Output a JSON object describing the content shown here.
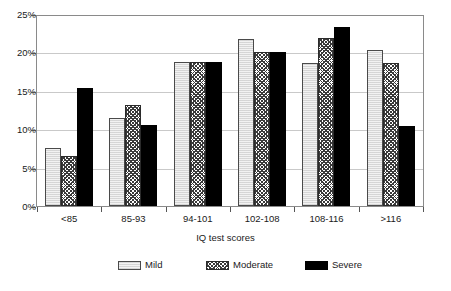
{
  "chart_data": {
    "type": "bar",
    "title": "",
    "xlabel": "IQ test scores",
    "ylabel": "",
    "categories": [
      "<85",
      "85-93",
      "94-101",
      "102-108",
      "108-116",
      ">116"
    ],
    "series": [
      {
        "name": "Mild",
        "values": [
          7.6,
          11.6,
          18.9,
          22.0,
          18.8,
          20.5
        ]
      },
      {
        "name": "Moderate",
        "values": [
          6.6,
          13.3,
          18.9,
          20.2,
          22.1,
          18.8
        ]
      },
      {
        "name": "Severe",
        "values": [
          15.5,
          10.6,
          18.9,
          20.2,
          23.6,
          10.5
        ]
      }
    ],
    "ylim": [
      0,
      25
    ],
    "ytick_labels": [
      "0%",
      "5%",
      "10%",
      "15%",
      "20%",
      "25%"
    ],
    "ytick_values": [
      0,
      5,
      10,
      15,
      20,
      25
    ],
    "grid": true,
    "grid_axis": "y",
    "legend_position": "bottom",
    "colors": {
      "mild": "#f2f2f2",
      "moderate": "#3a3a3a",
      "severe": "#000000",
      "axis": "#555555",
      "gridline": "#c9c9c9",
      "frame": "#8a8a8a",
      "text": "#1a1a1a"
    }
  },
  "legend": {
    "entries": [
      {
        "label": "Mild",
        "swatch": "light-stipple-swatch"
      },
      {
        "label": "Moderate",
        "swatch": "crosshatch-swatch"
      },
      {
        "label": "Severe",
        "swatch": "solid-black-swatch"
      }
    ]
  }
}
